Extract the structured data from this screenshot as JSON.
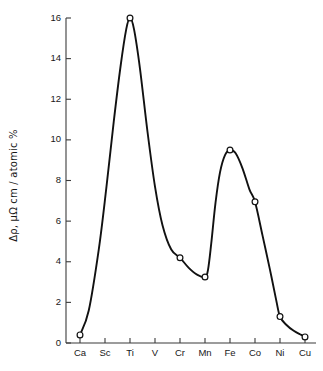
{
  "chart_data": {
    "type": "line",
    "title": "",
    "subtitle": "",
    "xlabel": "",
    "ylabel": "Δρ, μΩ cm / atomic %",
    "ylabel_parts": {
      "delta_rho": "Δρ",
      "separator": ", ",
      "units": "μΩ cm/atomic %"
    },
    "categories": [
      "Ca",
      "Sc",
      "Ti",
      "V",
      "Cr",
      "Mn",
      "Fe",
      "Co",
      "Ni",
      "Cu"
    ],
    "series": [
      {
        "name": "Δρ",
        "values": [
          0.4,
          null,
          16.0,
          null,
          4.2,
          3.25,
          9.5,
          6.95,
          1.3,
          0.3
        ],
        "marked_points": [
          {
            "x": "Ca",
            "y": 0.4
          },
          {
            "x": "Ti",
            "y": 16.0
          },
          {
            "x": "Cr",
            "y": 4.2
          },
          {
            "x": "Mn",
            "y": 3.25
          },
          {
            "x": "Fe",
            "y": 9.5
          },
          {
            "x": "Co",
            "y": 6.95
          },
          {
            "x": "Ni",
            "y": 1.3
          },
          {
            "x": "Cu",
            "y": 0.3
          }
        ],
        "marker": "open-circle",
        "line_color": "#111111",
        "marker_fill": "#ffffff"
      }
    ],
    "ylim": [
      0,
      16
    ],
    "yticks": [
      0,
      2,
      4,
      6,
      8,
      10,
      12,
      14,
      16
    ],
    "ytick_labels": [
      "0",
      "2",
      "4",
      "6",
      "8",
      "10",
      "12",
      "14",
      "16"
    ],
    "xticks": [
      "Ca",
      "Sc",
      "Ti",
      "V",
      "Cr",
      "Mn",
      "Fe",
      "Co",
      "Ni",
      "Cu"
    ],
    "grid": false,
    "legend": false,
    "legend_position": "none",
    "annotations": [],
    "axis_color": "#3b3b3b",
    "background": "#ffffff"
  }
}
